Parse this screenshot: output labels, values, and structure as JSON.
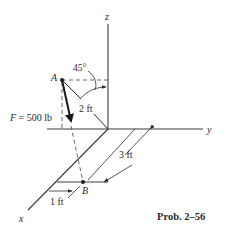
{
  "figure": {
    "caption": "Prob. 2–56",
    "axes": {
      "x": "x",
      "y": "y",
      "z": "z"
    },
    "points": {
      "A": "A",
      "B": "B"
    },
    "force_label": "F = 500 lb",
    "angle_label": "45°",
    "dimensions": {
      "AO": "2 ft",
      "along_x": "3 ft",
      "along_y": "1 ft"
    },
    "colors": {
      "line": "#2a2a2a",
      "dashed": "#555555",
      "background": "#ffffff"
    }
  }
}
